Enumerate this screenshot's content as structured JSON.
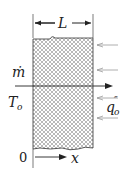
{
  "diagram": {
    "labels": {
      "thickness": "L",
      "mass_flow": "ṁ",
      "inlet_temperature_base": "T",
      "inlet_temperature_sub": "o",
      "heat_flux_base": "q",
      "heat_flux_prime": "″",
      "heat_flux_sub": "o",
      "origin": "0",
      "axis": "x"
    },
    "colors": {
      "line": "#222222",
      "hatch": "#888888",
      "heat_arrow": "#9a9a9a",
      "background": "#ffffff"
    },
    "heat_flux_arrow_count": 4
  }
}
